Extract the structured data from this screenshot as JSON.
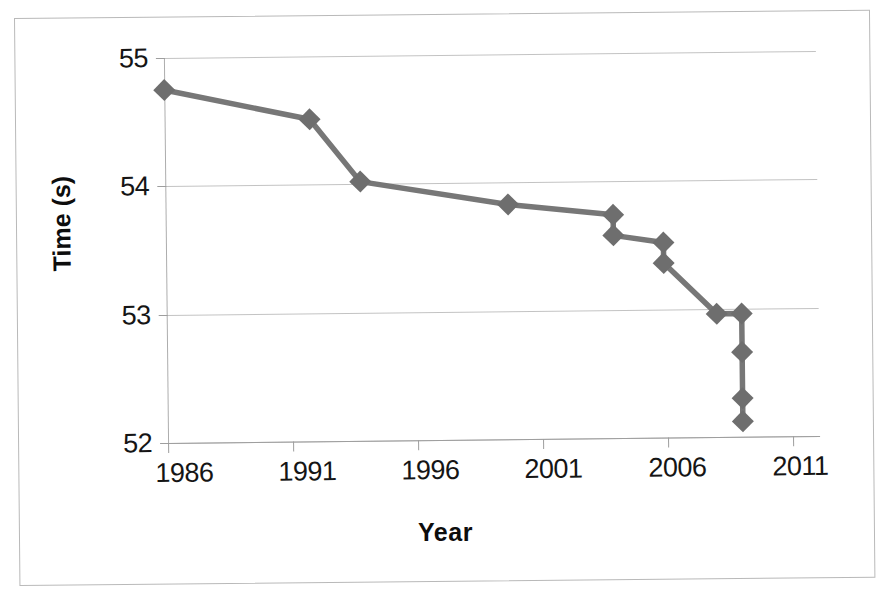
{
  "chart_data": {
    "type": "line",
    "title": "",
    "subtitle": "",
    "xlabel": "Year",
    "ylabel": "Time (s)",
    "xlim": [
      1986,
      2011
    ],
    "ylim": [
      52,
      55
    ],
    "xticks": [
      "1986",
      "1991",
      "1996",
      "2001",
      "2006",
      "2011"
    ],
    "xtick_values": [
      1986,
      1991,
      1996,
      2001,
      2006,
      2011
    ],
    "yticks": [
      "52",
      "53",
      "54",
      "55"
    ],
    "ytick_values": [
      52,
      53,
      54,
      55
    ],
    "grid": "horizontal",
    "legend": "none",
    "marker": "diamond",
    "marker_color": "#6e6e6e",
    "line_color": "#777777",
    "x": [
      1986.0,
      1991.8,
      1993.8,
      1999.7,
      2003.9,
      2003.9,
      2005.9,
      2005.9,
      2008.0,
      2009.0,
      2009.0,
      2009.0,
      2009.0
    ],
    "y": [
      54.75,
      54.51,
      54.02,
      53.83,
      53.74,
      53.58,
      53.52,
      53.36,
      52.96,
      52.96,
      52.66,
      52.3,
      52.12
    ],
    "series": [
      {
        "name": "Time",
        "points": [
          {
            "x": 1986.0,
            "y": 54.75
          },
          {
            "x": 1991.8,
            "y": 54.51
          },
          {
            "x": 1993.8,
            "y": 54.02
          },
          {
            "x": 1999.7,
            "y": 53.83
          },
          {
            "x": 2003.9,
            "y": 53.74
          },
          {
            "x": 2003.9,
            "y": 53.58
          },
          {
            "x": 2005.9,
            "y": 53.52
          },
          {
            "x": 2005.9,
            "y": 53.36
          },
          {
            "x": 2008.0,
            "y": 52.96
          },
          {
            "x": 2009.0,
            "y": 52.96
          },
          {
            "x": 2009.0,
            "y": 52.66
          },
          {
            "x": 2009.0,
            "y": 52.3
          },
          {
            "x": 2009.0,
            "y": 52.12
          }
        ]
      }
    ]
  },
  "axes": {
    "y_title": "Time (s)",
    "x_title": "Year",
    "y_tick_labels": [
      "55",
      "54",
      "53",
      "52"
    ],
    "x_tick_labels": [
      "1986",
      "1991",
      "1996",
      "2001",
      "2006",
      "2011"
    ]
  },
  "colors": {
    "line": "#777777",
    "marker": "#6e6e6e",
    "grid": "#c3c3c3",
    "axis": "#9e9e9e",
    "frame": "#b9b9b9",
    "text": "#151515",
    "background": "#ffffff"
  }
}
